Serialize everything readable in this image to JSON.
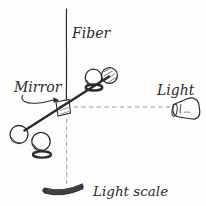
{
  "figure": {
    "labels": {
      "fiber": "Fiber",
      "mirror": "Mirror",
      "light": "Light",
      "light_scale": "Light scale"
    },
    "colors": {
      "ink": "#2b2b2b",
      "dashed_line": "#9a9a9a",
      "background": "#fdfdfd"
    }
  }
}
